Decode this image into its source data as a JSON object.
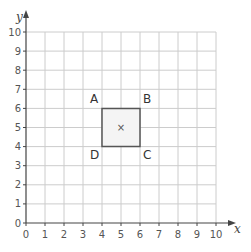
{
  "diagram": {
    "type": "coordinate-grid",
    "x_axis": {
      "label": "x",
      "min": 0,
      "max": 10,
      "ticks": [
        "0",
        "1",
        "2",
        "3",
        "4",
        "5",
        "6",
        "7",
        "8",
        "9",
        "10"
      ]
    },
    "y_axis": {
      "label": "y",
      "min": 0,
      "max": 10,
      "ticks": [
        "0",
        "1",
        "2",
        "3",
        "4",
        "5",
        "6",
        "7",
        "8",
        "9",
        "10"
      ]
    },
    "shape": {
      "name": "square ABCD",
      "fill": "#f4f4f4",
      "stroke": "#555555",
      "vertices": [
        {
          "label": "A",
          "x": 4,
          "y": 6
        },
        {
          "label": "B",
          "x": 6,
          "y": 6
        },
        {
          "label": "C",
          "x": 6,
          "y": 4
        },
        {
          "label": "D",
          "x": 4,
          "y": 4
        }
      ],
      "center_mark": {
        "symbol": "×",
        "x": 5,
        "y": 5
      }
    },
    "colors": {
      "grid": "#cccccc",
      "axis": "#444444"
    }
  }
}
